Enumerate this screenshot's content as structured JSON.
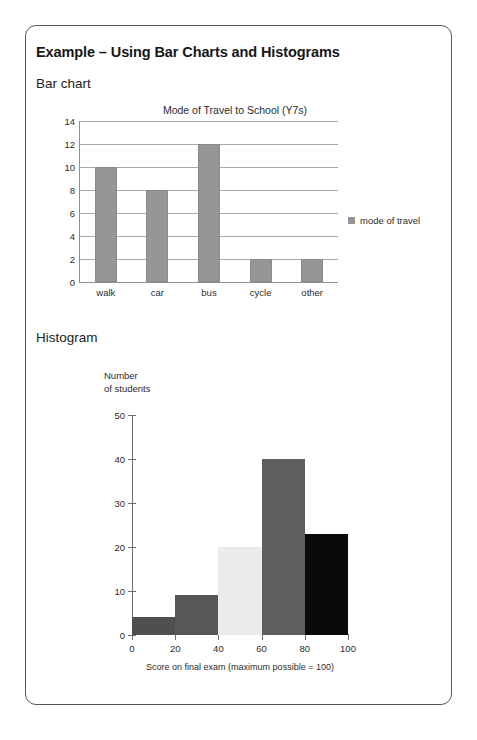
{
  "document": {
    "heading": "Example – Using Bar Charts and Histograms",
    "section_bar": "Bar chart",
    "section_histogram": "Histogram"
  },
  "chart_data": [
    {
      "type": "bar",
      "title": "Mode of Travel to School (Y7s)",
      "categories": [
        "walk",
        "car",
        "bus",
        "cycle",
        "other"
      ],
      "values": [
        10,
        8,
        12,
        2,
        2
      ],
      "series": [
        {
          "name": "mode of travel",
          "values": [
            10,
            8,
            12,
            2,
            2
          ]
        }
      ],
      "xlabel": "",
      "ylabel": "",
      "ylim": [
        0,
        14
      ],
      "yticks": [
        0,
        2,
        4,
        6,
        8,
        10,
        12,
        14
      ],
      "grid": "horizontal",
      "legend": {
        "position": "right",
        "entries": [
          "mode of travel"
        ]
      },
      "bar_color": "#969696"
    },
    {
      "type": "bar",
      "subtype": "histogram",
      "title": "",
      "ylabel": "Number\nof students",
      "ylabel_line1": "Number",
      "ylabel_line2": "of students",
      "xlabel": "Score on final exam (maximum possible = 100)",
      "bin_edges": [
        0,
        20,
        40,
        60,
        80,
        100
      ],
      "bin_labels": [
        "0–20",
        "20–40",
        "40–60",
        "60–80",
        "80–100"
      ],
      "values": [
        4,
        9,
        20,
        40,
        23
      ],
      "xlim": [
        0,
        100
      ],
      "ylim": [
        0,
        50
      ],
      "xticks": [
        0,
        20,
        40,
        60,
        80,
        100
      ],
      "yticks": [
        0,
        10,
        20,
        30,
        40,
        50
      ],
      "grid": "none",
      "bin_colors": [
        "#4f4f4f",
        "#575757",
        "#ebebeb",
        "#5e5e5e",
        "#0a0a0a"
      ]
    }
  ],
  "style": {
    "border_color": "#575757",
    "axis_color": "#6e6e6e",
    "grid_color": "#a9a9a9",
    "text_color": "#2b2b2b"
  }
}
